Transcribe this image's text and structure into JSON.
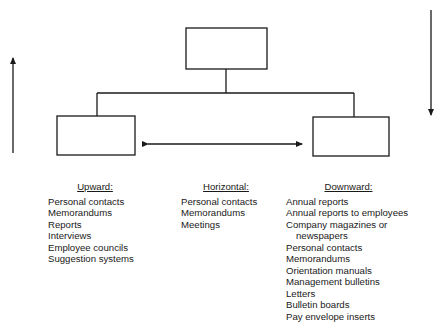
{
  "diagram": {
    "boxes": [
      {
        "id": "top",
        "x": 186,
        "y": 28,
        "w": 81,
        "h": 41
      },
      {
        "id": "left",
        "x": 57,
        "y": 116,
        "w": 78,
        "h": 39
      },
      {
        "id": "right",
        "x": 313,
        "y": 117,
        "w": 76,
        "h": 39
      }
    ],
    "arrows": {
      "upward": {
        "x": 13,
        "y_from": 153,
        "y_to": 55
      },
      "downward": {
        "x": 431,
        "y_from": 10,
        "y_to": 118
      },
      "horizontal": {
        "y": 144,
        "x_from": 142,
        "x_to": 305
      }
    },
    "stroke_color": "#1a1a1a"
  },
  "columns": {
    "upward": {
      "heading": "Upward:",
      "items": [
        "Personal contacts",
        "Memorandums",
        "Reports",
        "Interviews",
        "Employee councils",
        "Suggestion systems"
      ]
    },
    "horizontal": {
      "heading": "Horizontal:",
      "items": [
        "Personal contacts",
        "Memorandums",
        "Meetings"
      ]
    },
    "downward": {
      "heading": "Downward:",
      "items": [
        "Annual reports",
        "Annual reports to employees",
        "Company magazines or",
        "newspapers",
        "Personal contacts",
        "Memorandums",
        "Orientation manuals",
        "Management bulletins",
        "Letters",
        "Bulletin boards",
        "Pay envelope inserts"
      ]
    }
  }
}
